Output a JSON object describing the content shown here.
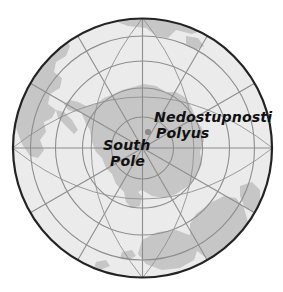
{
  "map": {
    "projection": "south-polar-azimuthal",
    "background_color": "#ffffff",
    "ocean_color": "#ebebeb",
    "land_color": "#c6c6c6",
    "graticule_color": "#8e8e8e",
    "outline_color": "#232323",
    "marker_color": "#8a8a8a",
    "label_color": "#111111",
    "center": {
      "x": 142.5,
      "y": 148
    },
    "radius": 130,
    "labels": [
      {
        "id": "nedostupnosti",
        "text": "Nedostupnosti"
      },
      {
        "id": "polyus",
        "text": "Polyus"
      },
      {
        "id": "south",
        "text": "South"
      },
      {
        "id": "pole",
        "text": "Pole"
      }
    ],
    "markers": [
      {
        "id": "pole-of-inaccessibility",
        "name": "Nedostupnosti Polyus",
        "x": 148,
        "y": 132
      },
      {
        "id": "south-pole",
        "name": "South Pole",
        "x": 143,
        "y": 146
      }
    ],
    "landmasses": [
      {
        "id": "antarctica",
        "name": "Antarctica"
      },
      {
        "id": "south-america",
        "name": "South America"
      },
      {
        "id": "africa",
        "name": "Africa"
      },
      {
        "id": "australia",
        "name": "Australia"
      },
      {
        "id": "new-zealand",
        "name": "New Zealand"
      }
    ],
    "graticule": {
      "parallels": [
        0.24,
        0.46,
        0.67,
        0.86,
        1.0
      ],
      "meridian_count": 12
    }
  }
}
